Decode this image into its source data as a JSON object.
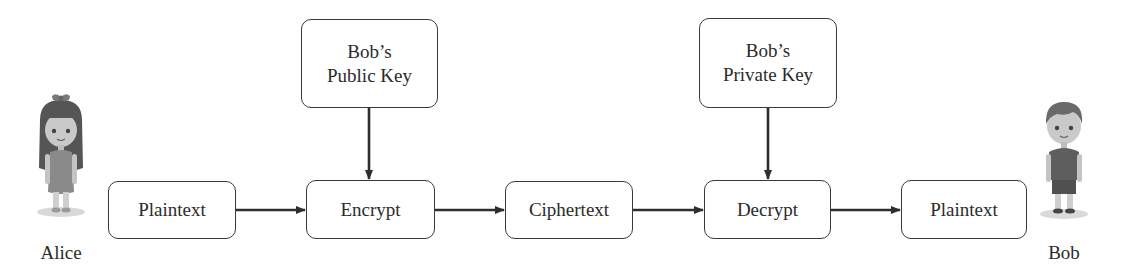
{
  "diagram": {
    "type": "public-key-encryption-flow",
    "actors": {
      "sender": {
        "label": "Alice",
        "icon": "girl-avatar-icon"
      },
      "receiver": {
        "label": "Bob",
        "icon": "boy-avatar-icon"
      }
    },
    "nodes": {
      "plaintext_in": {
        "label": "Plaintext"
      },
      "encrypt": {
        "label": "Encrypt"
      },
      "ciphertext": {
        "label": "Ciphertext"
      },
      "decrypt": {
        "label": "Decrypt"
      },
      "plaintext_out": {
        "label": "Plaintext"
      },
      "public_key": {
        "line1": "Bob’s",
        "line2": "Public Key"
      },
      "private_key": {
        "line1": "Bob’s",
        "line2": "Private Key"
      }
    },
    "edges": [
      {
        "from": "plaintext_in",
        "to": "encrypt"
      },
      {
        "from": "encrypt",
        "to": "ciphertext"
      },
      {
        "from": "ciphertext",
        "to": "decrypt"
      },
      {
        "from": "decrypt",
        "to": "plaintext_out"
      },
      {
        "from": "public_key",
        "to": "encrypt"
      },
      {
        "from": "private_key",
        "to": "decrypt"
      }
    ],
    "colors": {
      "stroke": "#3a3a3a",
      "text": "#2b2b2b",
      "background": "#ffffff"
    }
  }
}
